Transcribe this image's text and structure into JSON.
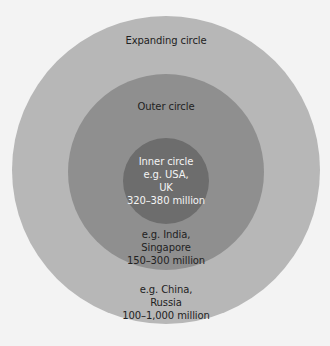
{
  "diagram": {
    "type": "concentric-circles",
    "colors": {
      "background": "#f3f3f3",
      "expanding_circle": "#b7b7b7",
      "outer_circle": "#8f8f8f",
      "inner_circle": "#6d6d6d",
      "dark_text": "#222222",
      "light_text": "#f4f4f4"
    },
    "expanding": {
      "title": "Expanding circle",
      "lines": [
        "e.g. China,",
        "Russia",
        "100–1,000 million"
      ]
    },
    "outer": {
      "title": "Outer circle",
      "lines": [
        "e.g. India,",
        "Singapore",
        "150–300 million"
      ]
    },
    "inner": {
      "title": "Inner circle",
      "lines": [
        "e.g. USA,",
        "UK",
        "320–380 million"
      ]
    }
  }
}
